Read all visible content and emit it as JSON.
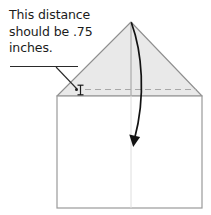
{
  "diagram": {
    "annotation": {
      "line1": "This distance",
      "line2": "should be",
      "line3": ".75 inches.",
      "full_text": "This distance should be .75 inches.",
      "measurement_value": ".75",
      "measurement_unit": "inches"
    },
    "shapes": {
      "rectangle_label": "paper-body-rectangle",
      "triangle_label": "folded-flap-triangle",
      "center_fold_label": "center-fold-crease",
      "dashed_fold_label": "horizontal-fold-line",
      "arrow_label": "fold-down-arrow",
      "marker_label": "distance-i-beam-marker",
      "leader_label": "annotation-leader-line",
      "underline_label": "annotation-underline"
    },
    "colors": {
      "triangle_fill": "#e8e8e8",
      "outline": "#8c8c8c",
      "dark_stroke": "#1b1b1b",
      "faint_line": "#d8d8d8",
      "background": "#ffffff",
      "text": "#1b1b1b"
    },
    "geometry": {
      "rect_left": 57,
      "rect_right": 202,
      "rect_top": 96,
      "rect_bottom": 208,
      "apex_x": 131,
      "apex_y": 22,
      "dashed_y": 89,
      "dashed_left": 85,
      "dashed_right": 197,
      "marker_x": 79,
      "marker_y": 90,
      "arrow_tip_x": 133,
      "arrow_tip_y": 146,
      "underline_y": 66,
      "underline_left": 10,
      "underline_right": 78
    }
  }
}
